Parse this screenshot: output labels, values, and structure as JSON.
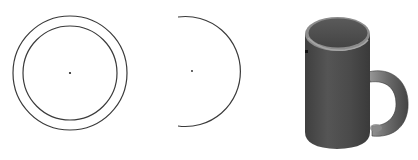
{
  "figures": [
    {
      "id": "double-circle",
      "description": "Two concentric circles with center point",
      "center": [
        70,
        73
      ],
      "outer_radius": 57,
      "inner_radius": 47
    },
    {
      "id": "arc",
      "description": "Open arc (partial circle) with center point",
      "center": [
        192,
        71
      ],
      "radius": 55
    },
    {
      "id": "mug",
      "description": "Shaded 3D mug render with handle"
    }
  ],
  "colors": {
    "stroke": "#3a3a3a",
    "mug_body": "#4e4e4e",
    "mug_dark": "#3c3c3c",
    "mug_light": "#8a8a8a",
    "background": "#ffffff"
  }
}
